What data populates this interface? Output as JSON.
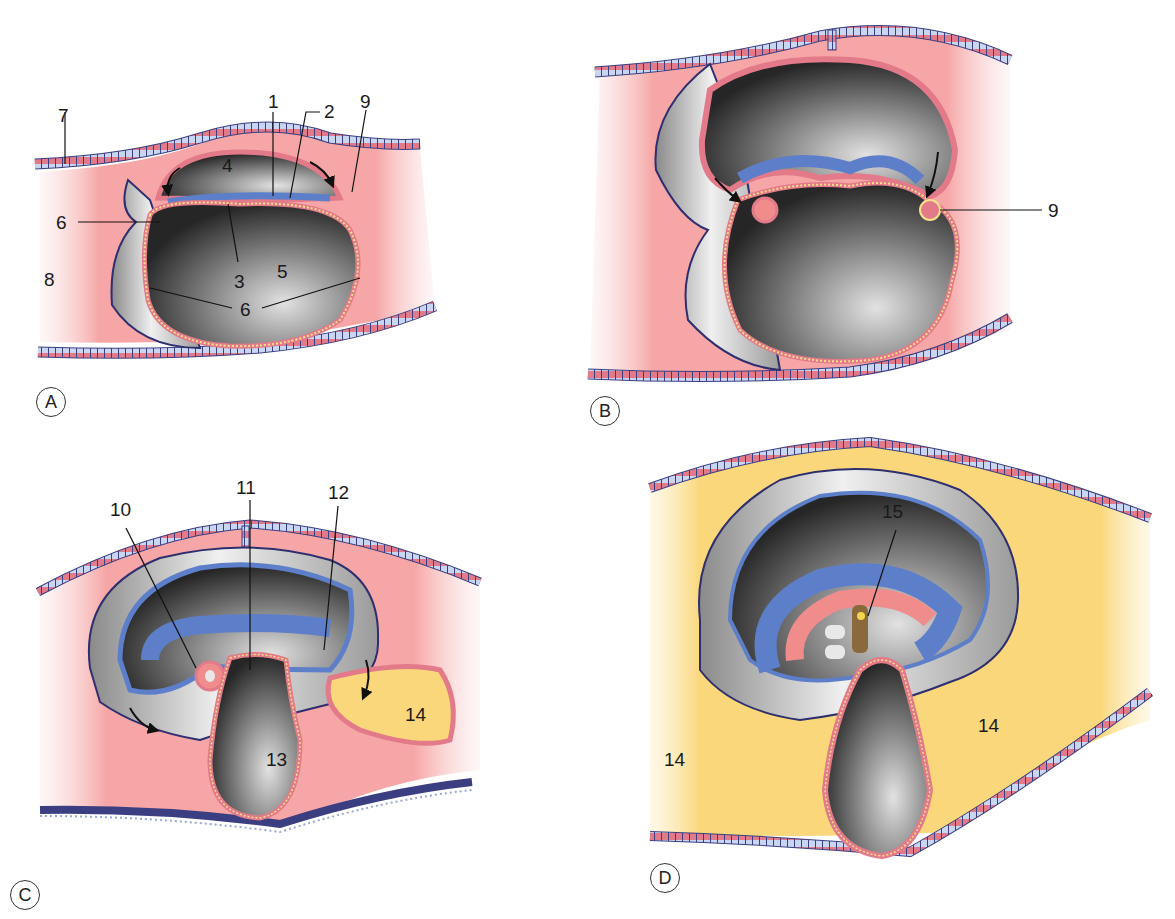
{
  "figure": {
    "type": "embryology-diagram",
    "panels": [
      {
        "id": "A",
        "letter": "A",
        "labels": [
          {
            "text": "1"
          },
          {
            "text": "2"
          },
          {
            "text": "9"
          },
          {
            "text": "7"
          },
          {
            "text": "4"
          },
          {
            "text": "6"
          },
          {
            "text": "3"
          },
          {
            "text": "5"
          },
          {
            "text": "8"
          },
          {
            "text": "6"
          }
        ]
      },
      {
        "id": "B",
        "letter": "B",
        "labels": [
          {
            "text": "9"
          }
        ]
      },
      {
        "id": "C",
        "letter": "C",
        "labels": [
          {
            "text": "10"
          },
          {
            "text": "11"
          },
          {
            "text": "12"
          },
          {
            "text": "13"
          },
          {
            "text": "14"
          }
        ]
      },
      {
        "id": "D",
        "letter": "D",
        "labels": [
          {
            "text": "15"
          },
          {
            "text": "14"
          },
          {
            "text": "14"
          }
        ]
      }
    ],
    "colors": {
      "decidua_pink": "#f4a3a3",
      "exocoelom_yellow": "#f9d77a",
      "amnion_blue": "#5d7fc9",
      "cavity_dark": "#3a3a3a",
      "cavity_light": "#cfcfcf",
      "epithelium_red": "#d9647a",
      "epithelium_light": "#c9d6f2",
      "outline": "#2e2f6e"
    }
  }
}
